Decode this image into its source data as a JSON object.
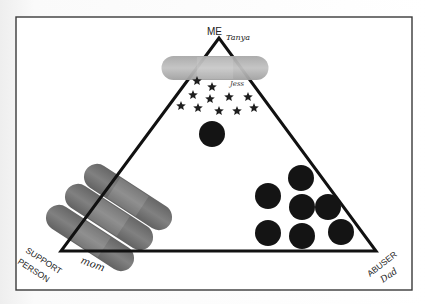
{
  "diagram": {
    "type": "relationship-triangle",
    "frame": {
      "x": 16,
      "y": 17,
      "width": 396,
      "height": 273,
      "stroke": "#3a3a3a"
    },
    "triangle": {
      "apex": [
        219,
        38
      ],
      "bottom_left": [
        61,
        251
      ],
      "bottom_right": [
        376,
        251
      ],
      "stroke": "#111111",
      "stroke_width": 3
    },
    "vertices": {
      "top": {
        "label": "ME",
        "handwritten": "Tanya"
      },
      "bottom_left": {
        "label_line1": "SUPPORT",
        "label_line2": "PERSON",
        "handwritten": "mom"
      },
      "bottom_right": {
        "label": "ABUSER",
        "handwritten": "Dad"
      }
    },
    "stickers": {
      "top_bandage": {
        "cx": 215,
        "cy": 68,
        "width": 107,
        "height": 24,
        "angle": 0,
        "color": "#b8b8b8"
      },
      "support_bandages": [
        {
          "cx": 128,
          "cy": 197,
          "width": 100,
          "height": 26,
          "angle": 33,
          "color": "#6e6e6e"
        },
        {
          "cx": 109,
          "cy": 217,
          "width": 100,
          "height": 26,
          "angle": 33,
          "color": "#727272"
        },
        {
          "cx": 90,
          "cy": 238,
          "width": 100,
          "height": 26,
          "angle": 33,
          "color": "#6a6a6a"
        }
      ],
      "star_color": "#1e1e1e",
      "stars": [
        {
          "x": 197,
          "y": 81
        },
        {
          "x": 212,
          "y": 87
        },
        {
          "x": 193,
          "y": 95
        },
        {
          "x": 210,
          "y": 99
        },
        {
          "x": 229,
          "y": 97
        },
        {
          "x": 248,
          "y": 97
        },
        {
          "x": 181,
          "y": 106
        },
        {
          "x": 198,
          "y": 108
        },
        {
          "x": 219,
          "y": 111
        },
        {
          "x": 237,
          "y": 111
        },
        {
          "x": 254,
          "y": 108
        }
      ],
      "star_scribble": {
        "x": 230,
        "y": 86,
        "text": "Jess"
      },
      "circle_color": "#141414",
      "me_circles": [
        {
          "cx": 212,
          "cy": 134,
          "r": 13
        }
      ],
      "abuser_circles": [
        {
          "cx": 301,
          "cy": 178,
          "r": 13
        },
        {
          "cx": 268,
          "cy": 196,
          "r": 13
        },
        {
          "cx": 302,
          "cy": 207,
          "r": 13
        },
        {
          "cx": 328,
          "cy": 207,
          "r": 13
        },
        {
          "cx": 268,
          "cy": 233,
          "r": 13
        },
        {
          "cx": 302,
          "cy": 236,
          "r": 13
        },
        {
          "cx": 341,
          "cy": 232,
          "r": 13
        }
      ]
    }
  }
}
